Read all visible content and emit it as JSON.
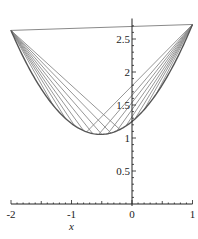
{
  "chart_data": {
    "type": "line",
    "title": "",
    "xlabel": "x",
    "ylabel": "",
    "xlim": [
      -2,
      1
    ],
    "ylim": [
      0,
      2.75
    ],
    "grid": false,
    "legend": null,
    "x_ticks": [
      {
        "value": -2,
        "label": "-2"
      },
      {
        "value": -1,
        "label": "-1"
      },
      {
        "value": 0,
        "label": "0"
      },
      {
        "value": 1,
        "label": "1"
      }
    ],
    "y_ticks": [
      {
        "value": 0.5,
        "label": "0.5"
      },
      {
        "value": 1,
        "label": "1"
      },
      {
        "value": 1.5,
        "label": "1.5"
      },
      {
        "value": 2,
        "label": "2"
      },
      {
        "value": 2.5,
        "label": "2.5"
      }
    ],
    "curve": {
      "name": "f(x)",
      "description": "convex curve, approx f(x) = 0.72x^2 + 0.75x + 1.25",
      "coeffs": [
        0.72,
        0.75,
        1.25
      ],
      "x_range": [
        -2,
        1
      ]
    },
    "endpoints": {
      "left": [
        -2,
        1.98
      ],
      "right": [
        1,
        2.72
      ]
    },
    "chords_from_left": [
      -0.2,
      -0.35,
      -0.5,
      -0.65,
      -0.8,
      -0.95,
      -1.1,
      -1.3
    ],
    "chords_from_right": [
      -0.75,
      -0.55,
      -0.4,
      -0.25,
      -0.1,
      0.05,
      0.2,
      0.4
    ],
    "colors": {
      "curve": "#555555",
      "chord": "#8a8a8a",
      "axis": "#222222"
    }
  }
}
